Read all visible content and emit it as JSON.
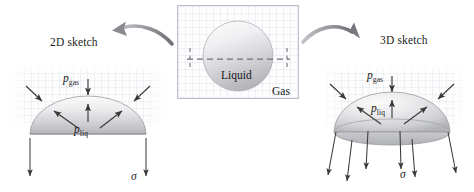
{
  "figure": {
    "background_color": "#ffffff"
  },
  "labels": {
    "left_title": "2D sketch",
    "right_title": "3D sketch",
    "center_liquid": "Liquid",
    "center_gas": "Gas",
    "p_gas_symbol": "p",
    "p_gas_subscript": "gas",
    "p_liq_symbol": "p",
    "p_liq_subscript": "liq",
    "sigma_left": "σ",
    "sigma_right": "σ"
  },
  "colors": {
    "ink": "#1b1b1b",
    "arrow": "#3a3a3a",
    "curved_arrow": "#8e8e93",
    "dome_light": "#f4f4f6",
    "dome_dark": "#b9b9bd",
    "drop_light": "#f2f2f4",
    "drop_dark": "#b5b5ba",
    "box_border": "#b9bec9",
    "grid": "#cdd4e0",
    "dashed": "#6f6f74"
  },
  "panels": {
    "left": {
      "label": "2d-sketch-panel",
      "x": 8,
      "y": 62,
      "w": 160,
      "h": 70
    },
    "center": {
      "label": "droplet-panel",
      "x": 176,
      "y": 4,
      "w": 123,
      "h": 96
    },
    "right": {
      "label": "3d-sketch-panel",
      "x": 318,
      "y": 62,
      "w": 150,
      "h": 70
    }
  },
  "geometry": {
    "left_dome": {
      "cx": 88,
      "cy": 134,
      "rx": 58,
      "ry": 38
    },
    "right_dome": {
      "cx": 392,
      "cy": 132,
      "rx": 58,
      "ry": 40,
      "base_ry": 13
    },
    "center_circle": {
      "cx": 238,
      "cy": 56,
      "r": 35
    },
    "center_dashed_y": 59
  },
  "arrows": {
    "left_pgas_count": 1,
    "left_inward_count": 2,
    "left_outward_count": 3,
    "left_down_count": 2,
    "right_pgas_count": 1,
    "right_inward_count": 2,
    "right_outward_count": 3,
    "right_down_count": 6
  }
}
